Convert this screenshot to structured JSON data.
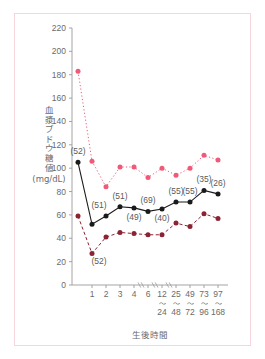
{
  "figure": {
    "border_color": "#f6d6dc",
    "background": "#ffffff"
  },
  "chart_data": {
    "type": "line",
    "title": "",
    "subtitle": "",
    "xlabel": "生後時間",
    "ylabel": "血漿ブドウ糖値",
    "ylabel_unit": "(mg/dL)",
    "ylim": [
      0,
      220
    ],
    "ytick_step": 20,
    "yticks": [
      0,
      20,
      40,
      60,
      80,
      100,
      120,
      140,
      160,
      180,
      200,
      220
    ],
    "ytick_labels": [
      "0",
      "20",
      "40",
      "60",
      "80",
      "100",
      "120",
      "140",
      "160",
      "180",
      "200",
      "220"
    ],
    "grid": false,
    "legend": "none",
    "axis_break_marks": 3,
    "categories": [
      "0",
      "1",
      "2",
      "3",
      "4",
      "6",
      "12",
      "25",
      "49",
      "73",
      "97"
    ],
    "xtick_labels": [
      "",
      "1",
      "2",
      "3",
      "4",
      "6",
      "12",
      "25",
      "49",
      "73",
      "97"
    ],
    "xtick_sublabels": [
      "",
      "",
      "",
      "",
      "",
      "",
      "24",
      "48",
      "72",
      "96",
      "168"
    ],
    "xtick_sublabel_prefix": "～",
    "series": [
      {
        "name": "upper-percentile",
        "color": "#ef5a78",
        "line_style": "dotted",
        "marker": "circle",
        "values": [
          183,
          106,
          84,
          101,
          101,
          92,
          100,
          94,
          100,
          111,
          107
        ]
      },
      {
        "name": "median",
        "color": "#1a1a1a",
        "line_style": "solid",
        "marker": "circle",
        "values": [
          105,
          52,
          59,
          67,
          66,
          63,
          65,
          71,
          71,
          81,
          78
        ]
      },
      {
        "name": "lower-percentile",
        "color": "#8c2332",
        "line_style": "dashed",
        "marker": "circle",
        "values": [
          59,
          27,
          41,
          45,
          44,
          43,
          43,
          53,
          50,
          61,
          57
        ]
      }
    ],
    "annotations": [
      {
        "text": "(52)",
        "x_index": 0,
        "value": 105,
        "placement": "above"
      },
      {
        "text": "(52)",
        "x_index": 1,
        "value": 27,
        "placement": "below-right"
      },
      {
        "text": "(51)",
        "x_index": 2,
        "value": 59,
        "placement": "above-left"
      },
      {
        "text": "(51)",
        "x_index": 3,
        "value": 67,
        "placement": "above"
      },
      {
        "text": "(49)",
        "x_index": 4,
        "value": 66,
        "placement": "below"
      },
      {
        "text": "(69)",
        "x_index": 5,
        "value": 63,
        "placement": "above"
      },
      {
        "text": "(40)",
        "x_index": 6,
        "value": 65,
        "placement": "below"
      },
      {
        "text": "(55)",
        "x_index": 7,
        "value": 71,
        "placement": "above"
      },
      {
        "text": "(55)",
        "x_index": 8,
        "value": 71,
        "placement": "above"
      },
      {
        "text": "(35)",
        "x_index": 9,
        "value": 81,
        "placement": "above"
      },
      {
        "text": "(26)",
        "x_index": 10,
        "value": 78,
        "placement": "above"
      }
    ],
    "colors": {
      "upper": "#ef5a78",
      "median": "#1a1a1a",
      "lower": "#8c2332",
      "axis": "#9a9a9a",
      "tick_text": "#6b6b6b",
      "annotation_text": "#5a5a5a"
    }
  }
}
